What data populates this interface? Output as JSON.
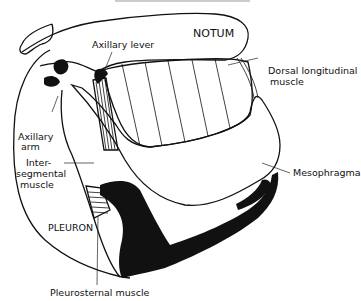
{
  "diagram": {
    "colors": {
      "ink": "#111111",
      "background": "#ffffff",
      "stipple": "#555555"
    },
    "labels": {
      "notum": "NOTUM",
      "axillary_lever": "Axillary lever",
      "dorsal_longitudinal_line1": "Dorsal longitudinal",
      "dorsal_longitudinal_line2": "muscle",
      "axillary_arm_line1": "Axillary",
      "axillary_arm_line2": "arm",
      "intersegmental_line1": "Inter-",
      "intersegmental_line2": "segmental",
      "intersegmental_line3": "muscle",
      "mesophragma": "Mesophragma",
      "pleuron": "PLEURON",
      "pleurosternal": "Pleurosternal muscle"
    }
  }
}
